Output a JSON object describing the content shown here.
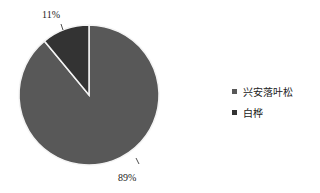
{
  "chart_data": {
    "type": "pie",
    "title": "",
    "categories": [
      "兴安落叶松",
      "白桦"
    ],
    "values": [
      89,
      11
    ],
    "labels": [
      "89%",
      "11%"
    ],
    "colors": [
      "#585858",
      "#333333"
    ],
    "start_angle_deg": 0,
    "direction": "clockwise",
    "legend_position": "right"
  },
  "legend": {
    "items": [
      {
        "label": "兴安落叶松",
        "color": "#585858"
      },
      {
        "label": "白桦",
        "color": "#333333"
      }
    ]
  },
  "slice_labels": {
    "larch": "89%",
    "birch": "11%"
  }
}
